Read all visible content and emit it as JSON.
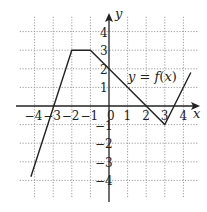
{
  "chart_data": {
    "type": "line",
    "title": "",
    "function_label": "y = f(x)",
    "xlabel": "x",
    "ylabel": "y",
    "xlim": [
      -4.5,
      4.8
    ],
    "ylim": [
      -4.5,
      4.8
    ],
    "grid": true,
    "x_ticks": [
      "-4",
      "-3",
      "-2",
      "-1",
      "0",
      "1",
      "2",
      "3",
      "4"
    ],
    "y_ticks": [
      "4",
      "3",
      "2",
      "1",
      "-1",
      "-2",
      "-3",
      "-4"
    ],
    "series": [
      {
        "name": "f(x)",
        "points": [
          [
            -4.2,
            -3.8
          ],
          [
            -2,
            3
          ],
          [
            -1,
            3
          ],
          [
            0,
            2
          ],
          [
            3,
            -1
          ],
          [
            4.4,
            1.8
          ]
        ]
      }
    ]
  }
}
